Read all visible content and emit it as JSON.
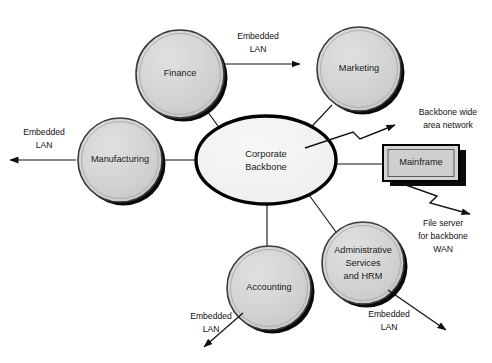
{
  "diagram": {
    "background_color": "#ffffff",
    "node_fill": "#d4d4d4",
    "node_stroke": "#3a3a3a",
    "shadow_color": "#000000",
    "center_fill": "#f2f2f2",
    "center_stroke": "#000000",
    "line_color": "#111111",
    "text_color": "#111111"
  },
  "center": {
    "label_line1": "Corporate",
    "label_line2": "Backbone",
    "shape": "ellipse"
  },
  "nodes": [
    {
      "id": "finance",
      "label_line1": "Finance",
      "label_line2": "",
      "label_line3": "",
      "shape": "circle"
    },
    {
      "id": "marketing",
      "label_line1": "Marketing",
      "label_line2": "",
      "label_line3": "",
      "shape": "circle"
    },
    {
      "id": "manufacturing",
      "label_line1": "Manufacturing",
      "label_line2": "",
      "label_line3": "",
      "shape": "circle"
    },
    {
      "id": "accounting",
      "label_line1": "Accounting",
      "label_line2": "",
      "label_line3": "",
      "shape": "circle"
    },
    {
      "id": "admin-services",
      "label_line1": "Administrative",
      "label_line2": "Services",
      "label_line3": "and HRM",
      "shape": "circle"
    }
  ],
  "mainframe": {
    "label": "Mainframe",
    "shape": "box-3d"
  },
  "edge_labels": [
    {
      "id": "finance-lan",
      "line1": "Embedded",
      "line2": "LAN"
    },
    {
      "id": "manufacturing-lan",
      "line1": "Embedded",
      "line2": "LAN"
    },
    {
      "id": "accounting-lan",
      "line1": "Embedded",
      "line2": "LAN"
    },
    {
      "id": "admin-lan",
      "line1": "Embedded",
      "line2": "LAN"
    }
  ],
  "annotations": [
    {
      "id": "backbone-wan",
      "line1": "Backbone wide",
      "line2": "area network",
      "line3": ""
    },
    {
      "id": "file-server-wan",
      "line1": "File server",
      "line2": "for backbone",
      "line3": "WAN"
    }
  ]
}
